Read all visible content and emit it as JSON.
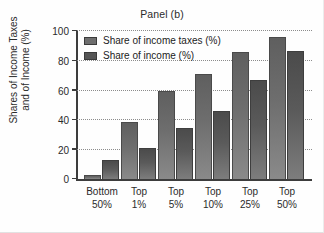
{
  "chart_data": {
    "type": "bar",
    "title": "Panel (b)",
    "xlabel": "",
    "ylabel": "Shares of Income Taxes\nand of Income (%)",
    "ylim": [
      0,
      100
    ],
    "yticks": [
      0,
      20,
      40,
      60,
      80,
      100
    ],
    "ytick_labels": [
      "0",
      "20",
      "40",
      "60",
      "80",
      "100"
    ],
    "grid": true,
    "legend_position": "upper-left-inside",
    "categories": [
      "Bottom\n50%",
      "Top\n1%",
      "Top\n5%",
      "Top\n10%",
      "Top\n25%",
      "Top\n50%"
    ],
    "series": [
      {
        "name": "Share of income taxes (%)",
        "color": "#6e6e6e",
        "values": [
          3,
          39,
          60,
          71,
          86,
          96
        ]
      },
      {
        "name": "Share of income (%)",
        "color": "#555555",
        "values": [
          13,
          21,
          35,
          46,
          67,
          87
        ]
      }
    ]
  },
  "legend": {
    "items": [
      {
        "label": "Share of income taxes (%)"
      },
      {
        "label": "Share of income (%)"
      }
    ]
  }
}
